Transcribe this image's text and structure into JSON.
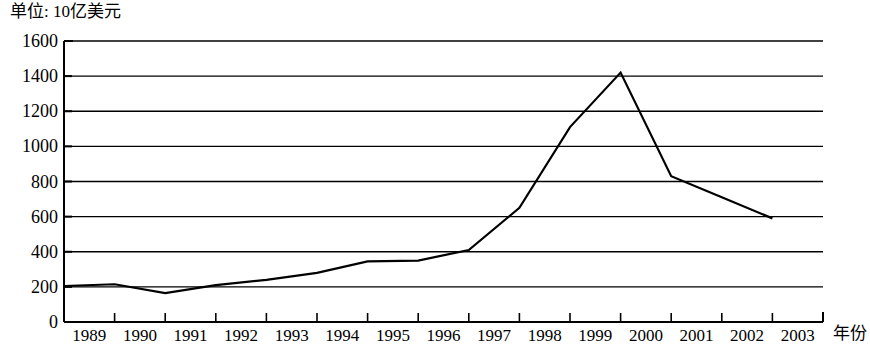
{
  "chart_data": {
    "type": "line",
    "title": "单位: 10亿美元",
    "xlabel": "年份",
    "ylabel": "",
    "categories": [
      "1989",
      "1990",
      "1991",
      "1992",
      "1993",
      "1994",
      "1995",
      "1996",
      "1997",
      "1998",
      "1999",
      "2000",
      "2001",
      "2002",
      "2003"
    ],
    "values": [
      205,
      215,
      165,
      210,
      240,
      280,
      345,
      350,
      410,
      650,
      1110,
      1420,
      830,
      710,
      590
    ],
    "series": [
      {
        "name": "",
        "values": [
          205,
          215,
          165,
          210,
          240,
          280,
          345,
          350,
          410,
          650,
          1110,
          1420,
          830,
          710,
          590
        ]
      }
    ],
    "ylim": [
      0,
      1600
    ],
    "ytick_values": [
      0,
      200,
      400,
      600,
      800,
      1000,
      1200,
      1400,
      1600
    ],
    "ytick_labels": [
      "0",
      "200",
      "400",
      "600",
      "800",
      "1000",
      "1200",
      "1400",
      "1600"
    ],
    "grid": "horizontal",
    "legend": "none",
    "line_color": "#000000",
    "grid_color": "#000000",
    "background_color": "#ffffff"
  },
  "axis": {
    "unit_note": "单位: 10亿美元",
    "x_title": "年份"
  }
}
